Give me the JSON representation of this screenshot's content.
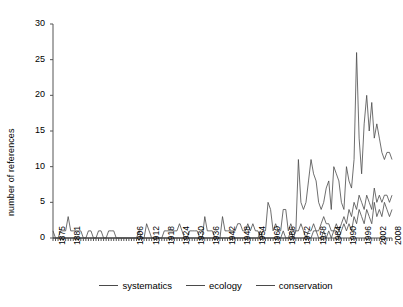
{
  "chart_data": {
    "type": "line",
    "title": "",
    "xlabel": "",
    "ylabel": "number of references",
    "ylim": [
      0,
      30
    ],
    "yticks": [
      0,
      5,
      10,
      15,
      20,
      25,
      30
    ],
    "xlim": [
      1875,
      2010
    ],
    "xticks": [
      1875,
      1881,
      1906,
      1912,
      1918,
      1924,
      1930,
      1936,
      1942,
      1948,
      1954,
      1960,
      1966,
      1972,
      1978,
      1984,
      1990,
      1996,
      2002,
      2008
    ],
    "grid": false,
    "legend_position": "bottom-center",
    "line_color": "#4a4a4a",
    "x": [
      1875,
      1876,
      1877,
      1878,
      1879,
      1880,
      1881,
      1882,
      1883,
      1884,
      1885,
      1886,
      1887,
      1888,
      1889,
      1890,
      1891,
      1892,
      1893,
      1894,
      1895,
      1896,
      1897,
      1898,
      1899,
      1900,
      1901,
      1902,
      1903,
      1904,
      1905,
      1906,
      1907,
      1908,
      1909,
      1910,
      1911,
      1912,
      1913,
      1914,
      1915,
      1916,
      1917,
      1918,
      1919,
      1920,
      1921,
      1922,
      1923,
      1924,
      1925,
      1926,
      1927,
      1928,
      1929,
      1930,
      1931,
      1932,
      1933,
      1934,
      1935,
      1936,
      1937,
      1938,
      1939,
      1940,
      1941,
      1942,
      1943,
      1944,
      1945,
      1946,
      1947,
      1948,
      1949,
      1950,
      1951,
      1952,
      1953,
      1954,
      1955,
      1956,
      1957,
      1958,
      1959,
      1960,
      1961,
      1962,
      1963,
      1964,
      1965,
      1966,
      1967,
      1968,
      1969,
      1970,
      1971,
      1972,
      1973,
      1974,
      1975,
      1976,
      1977,
      1978,
      1979,
      1980,
      1981,
      1982,
      1983,
      1984,
      1985,
      1986,
      1987,
      1988,
      1989,
      1990,
      1991,
      1992,
      1993,
      1994,
      1995,
      1996,
      1997,
      1998,
      1999,
      2000,
      2001,
      2002,
      2003,
      2004,
      2005,
      2006,
      2007,
      2008,
      2009
    ],
    "series": [
      {
        "name": "systematics",
        "values": [
          1,
          0,
          0,
          1,
          1,
          1,
          3,
          1,
          1,
          1,
          1,
          1,
          0,
          0,
          1,
          1,
          0,
          0,
          1,
          1,
          0,
          0,
          1,
          1,
          1,
          0,
          0,
          0,
          0,
          0,
          0,
          0,
          0,
          0,
          1,
          0,
          0,
          2,
          1,
          0,
          0,
          0,
          0,
          0,
          1,
          1,
          1,
          1,
          1,
          1,
          2,
          1,
          0,
          0,
          1,
          1,
          1,
          1,
          0,
          0,
          3,
          1,
          1,
          1,
          0,
          0,
          0,
          3,
          1,
          1,
          1,
          1,
          1,
          2,
          2,
          1,
          1,
          2,
          1,
          2,
          1,
          1,
          0,
          1,
          1,
          5,
          4,
          1,
          2,
          1,
          1,
          4,
          4,
          1,
          2,
          1,
          1,
          11,
          5,
          4,
          5,
          8,
          11,
          9,
          8,
          5,
          4,
          5,
          7,
          8,
          4,
          10,
          9,
          8,
          5,
          4,
          10,
          8,
          7,
          11,
          26,
          14,
          9,
          16,
          20,
          15,
          19,
          14,
          16,
          14,
          12,
          11,
          12,
          12,
          11
        ]
      },
      {
        "name": "ecology",
        "values": [
          0,
          0,
          0,
          0,
          0,
          0,
          0,
          0,
          0,
          0,
          0,
          0,
          0,
          0,
          0,
          0,
          0,
          0,
          0,
          0,
          0,
          0,
          0,
          0,
          0,
          0,
          0,
          0,
          0,
          0,
          0,
          0,
          0,
          0,
          0,
          0,
          0,
          0,
          0,
          0,
          0,
          0,
          0,
          0,
          0,
          0,
          0,
          0,
          0,
          0,
          0,
          0,
          0,
          0,
          0,
          0,
          0,
          0,
          0,
          0,
          0,
          0,
          0,
          0,
          0,
          0,
          0,
          0,
          0,
          0,
          0,
          0,
          0,
          0,
          0,
          0,
          0,
          0,
          0,
          0,
          0,
          0,
          1,
          0,
          0,
          0,
          0,
          0,
          0,
          0,
          0,
          1,
          0,
          0,
          1,
          0,
          1,
          1,
          2,
          1,
          0,
          1,
          1,
          2,
          1,
          1,
          2,
          3,
          2,
          2,
          1,
          1,
          2,
          1,
          2,
          3,
          2,
          4,
          3,
          5,
          4,
          6,
          5,
          4,
          6,
          5,
          4,
          7,
          5,
          6,
          5,
          6,
          6,
          5,
          6
        ]
      },
      {
        "name": "conservation",
        "values": [
          0,
          0,
          0,
          0,
          0,
          0,
          0,
          0,
          0,
          0,
          0,
          0,
          0,
          0,
          0,
          0,
          0,
          0,
          0,
          0,
          0,
          0,
          0,
          0,
          0,
          0,
          0,
          0,
          0,
          0,
          0,
          0,
          0,
          0,
          0,
          0,
          0,
          0,
          0,
          0,
          0,
          0,
          0,
          0,
          0,
          0,
          0,
          0,
          0,
          0,
          0,
          0,
          0,
          0,
          0,
          0,
          0,
          0,
          0,
          0,
          0,
          0,
          0,
          0,
          0,
          0,
          0,
          0,
          0,
          0,
          0,
          0,
          0,
          0,
          0,
          0,
          0,
          0,
          0,
          0,
          0,
          0,
          0,
          0,
          0,
          0,
          0,
          0,
          0,
          0,
          0,
          0,
          0,
          0,
          0,
          0,
          0,
          0,
          0,
          0,
          0,
          0,
          0,
          1,
          1,
          0,
          0,
          1,
          0,
          1,
          0,
          1,
          1,
          0,
          1,
          2,
          1,
          2,
          1,
          3,
          2,
          4,
          3,
          2,
          4,
          3,
          2,
          5,
          3,
          4,
          3,
          5,
          4,
          3,
          4
        ]
      }
    ],
    "legend": [
      "systematics",
      "ecology",
      "conservation"
    ]
  }
}
